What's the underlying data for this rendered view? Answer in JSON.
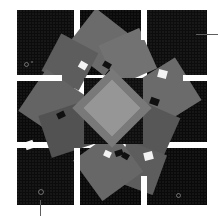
{
  "figure": {
    "canvas": {
      "width": 218,
      "height": 216,
      "background": "#ffffff"
    },
    "palette": {
      "block_dark": "#0b0b0b",
      "square_gray": "#8a8a8a",
      "square_light": "#c9c9c9",
      "square_bright": "#d6d6d6",
      "square_mid": "#7c7c7c",
      "square_deep": "#6e6e6e",
      "highlight": "#f2f2f2",
      "leader_line": "#5f5f5f",
      "gutter": "#ffffff"
    },
    "grid": {
      "rows": 3,
      "columns": 3,
      "gutter_px": 6,
      "left": 17,
      "top": 10,
      "right": 207,
      "bottom": 205,
      "column_edges": [
        17,
        74,
        80,
        141,
        147,
        207
      ],
      "row_edges": [
        10,
        75,
        81,
        142,
        148,
        205
      ],
      "blocks": [
        {
          "name": "block-r1c1",
          "x": 17,
          "y": 10,
          "w": 57,
          "h": 65,
          "tone": "#0c0c0c"
        },
        {
          "name": "block-r1c2",
          "x": 80,
          "y": 10,
          "w": 61,
          "h": 65,
          "tone": "#090909"
        },
        {
          "name": "block-r1c3",
          "x": 147,
          "y": 10,
          "w": 60,
          "h": 65,
          "tone": "#0d0d0d"
        },
        {
          "name": "block-r2c1",
          "x": 17,
          "y": 81,
          "w": 57,
          "h": 61,
          "tone": "#0a0a0a"
        },
        {
          "name": "block-r2c2",
          "x": 84,
          "y": 78,
          "w": 59,
          "h": 66,
          "tone": "#0e0e0e"
        },
        {
          "name": "block-r2c3",
          "x": 147,
          "y": 81,
          "w": 60,
          "h": 61,
          "tone": "#0b0b0b"
        },
        {
          "name": "block-r3c1",
          "x": 17,
          "y": 148,
          "w": 57,
          "h": 57,
          "tone": "#0c0c0c"
        },
        {
          "name": "block-r3c2",
          "x": 80,
          "y": 148,
          "w": 61,
          "h": 57,
          "tone": "#090909"
        },
        {
          "name": "block-r3c3",
          "x": 147,
          "y": 148,
          "w": 60,
          "h": 57,
          "tone": "#0a0a0a"
        }
      ]
    },
    "squares": [
      {
        "name": "square-top",
        "cx": 100,
        "cy": 42,
        "size": 48,
        "rotate": 38,
        "tone": "#8f8f8f"
      },
      {
        "name": "square-top-right",
        "cx": 128,
        "cy": 57,
        "size": 44,
        "rotate": -24,
        "tone": "#999999"
      },
      {
        "name": "square-upper-left",
        "cx": 70,
        "cy": 62,
        "size": 42,
        "rotate": 28,
        "tone": "#7c7c7c"
      },
      {
        "name": "square-left",
        "cx": 53,
        "cy": 104,
        "size": 50,
        "rotate": 34,
        "tone": "#868686"
      },
      {
        "name": "square-left-lower",
        "cx": 66,
        "cy": 130,
        "size": 44,
        "rotate": -18,
        "tone": "#6e6e6e"
      },
      {
        "name": "square-right",
        "cx": 167,
        "cy": 92,
        "size": 50,
        "rotate": -32,
        "tone": "#8f8f8f"
      },
      {
        "name": "square-right-lower",
        "cx": 150,
        "cy": 130,
        "size": 46,
        "rotate": 24,
        "tone": "#757575"
      },
      {
        "name": "square-bottom",
        "cx": 108,
        "cy": 166,
        "size": 50,
        "rotate": -36,
        "tone": "#8a8a8a"
      },
      {
        "name": "square-bottom-right",
        "cx": 140,
        "cy": 168,
        "size": 42,
        "rotate": 20,
        "tone": "#7c7c7c"
      },
      {
        "name": "square-inner-ring",
        "cx": 112,
        "cy": 108,
        "size": 56,
        "rotate": 45,
        "tone": "#a2a2a2"
      },
      {
        "name": "square-center-diamond",
        "cx": 112,
        "cy": 108,
        "size": 40,
        "rotate": 45,
        "tone": "#c9c9c9"
      }
    ],
    "highlights": [
      {
        "name": "highlight-chip-top",
        "x": 79,
        "y": 62,
        "w": 8,
        "h": 7,
        "rotate": 30,
        "tone": "#f2f2f2"
      },
      {
        "name": "highlight-chip-left",
        "x": 25,
        "y": 141,
        "w": 9,
        "h": 8,
        "rotate": -20,
        "tone": "#f2f2f2"
      },
      {
        "name": "highlight-chip-right",
        "x": 158,
        "y": 70,
        "w": 9,
        "h": 8,
        "rotate": 15,
        "tone": "#f2f2f2"
      },
      {
        "name": "highlight-chip-bottom",
        "x": 144,
        "y": 152,
        "w": 9,
        "h": 8,
        "rotate": -14,
        "tone": "#f2f2f2"
      },
      {
        "name": "highlight-chip-bottom-left",
        "x": 104,
        "y": 151,
        "w": 7,
        "h": 6,
        "rotate": 25,
        "tone": "#f2f2f2"
      },
      {
        "name": "shadow-chip-top",
        "x": 103,
        "y": 62,
        "w": 8,
        "h": 6,
        "rotate": 30,
        "tone": "#101010"
      },
      {
        "name": "shadow-chip-left",
        "x": 57,
        "y": 112,
        "w": 8,
        "h": 6,
        "rotate": -25,
        "tone": "#101010"
      },
      {
        "name": "shadow-chip-right",
        "x": 150,
        "y": 98,
        "w": 9,
        "h": 7,
        "rotate": 20,
        "tone": "#101010"
      },
      {
        "name": "shadow-chip-bottom",
        "x": 115,
        "y": 150,
        "w": 8,
        "h": 6,
        "rotate": -18,
        "tone": "#101010"
      },
      {
        "name": "shadow-chip-mid",
        "x": 122,
        "y": 153,
        "w": 7,
        "h": 6,
        "rotate": 30,
        "tone": "#101010"
      }
    ],
    "specks": [
      {
        "name": "speck-top-left-a",
        "x": 24,
        "y": 62,
        "d": 3,
        "style": "ring"
      },
      {
        "name": "speck-top-left-b",
        "x": 31,
        "y": 61,
        "d": 2,
        "style": "dot"
      },
      {
        "name": "speck-bottom-left",
        "x": 38,
        "y": 189,
        "d": 4,
        "style": "ring"
      },
      {
        "name": "speck-bottom-right",
        "x": 176,
        "y": 193,
        "d": 3,
        "style": "ring"
      }
    ],
    "leader_lines": [
      {
        "name": "leader-line-right",
        "orientation": "horizontal",
        "x": 196,
        "y": 34,
        "length": 22,
        "color": "#5f5f5f"
      },
      {
        "name": "leader-line-bottom-left",
        "orientation": "vertical",
        "x": 40,
        "y": 200,
        "length": 16,
        "color": "#5f5f5f"
      }
    ]
  }
}
